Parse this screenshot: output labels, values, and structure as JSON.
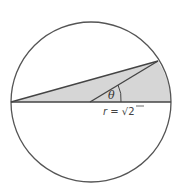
{
  "diagram": {
    "type": "geometry",
    "angle_label": "θ",
    "radius_label": {
      "prefix": "r = ",
      "radical": "√",
      "radicand": "2"
    },
    "colors": {
      "stroke": "#555555",
      "fill": "#d6d6d6",
      "background": "#ffffff"
    }
  }
}
